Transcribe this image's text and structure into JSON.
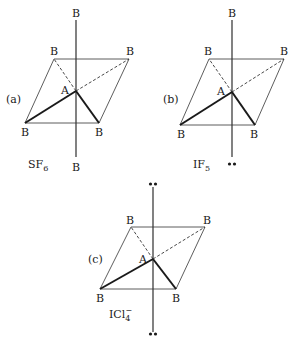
{
  "figure": {
    "panels": [
      {
        "id": "a",
        "panel_label": "(a)",
        "molecule": "SF",
        "molecule_sub": "6",
        "molecule_sup": "",
        "center_label": "A",
        "ligand_label": "B",
        "axial_top": "B",
        "axial_bottom": "B"
      },
      {
        "id": "b",
        "panel_label": "(b)",
        "molecule": "IF",
        "molecule_sub": "5",
        "molecule_sup": "",
        "center_label": "A",
        "ligand_label": "B",
        "axial_top": "B",
        "axial_bottom": "lone-pair"
      },
      {
        "id": "c",
        "panel_label": "(c)",
        "molecule": "ICl",
        "molecule_sub": "4",
        "molecule_sup": "−",
        "center_label": "A",
        "ligand_label": "B",
        "axial_top": "lone-pair",
        "axial_bottom": "lone-pair"
      }
    ],
    "lone_pair_glyph": "••"
  }
}
